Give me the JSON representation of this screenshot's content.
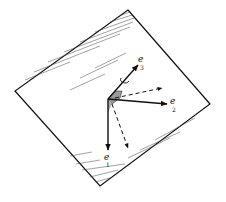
{
  "figure": {
    "labels": {
      "e1": {
        "base": "e",
        "sub": "1"
      },
      "e2": {
        "base": "e",
        "sub": "2"
      },
      "e3": {
        "base": "e",
        "sub": "3"
      }
    },
    "colors": {
      "ink": "#111111",
      "shade": "#9a9a9a",
      "background": "#ffffff"
    }
  }
}
